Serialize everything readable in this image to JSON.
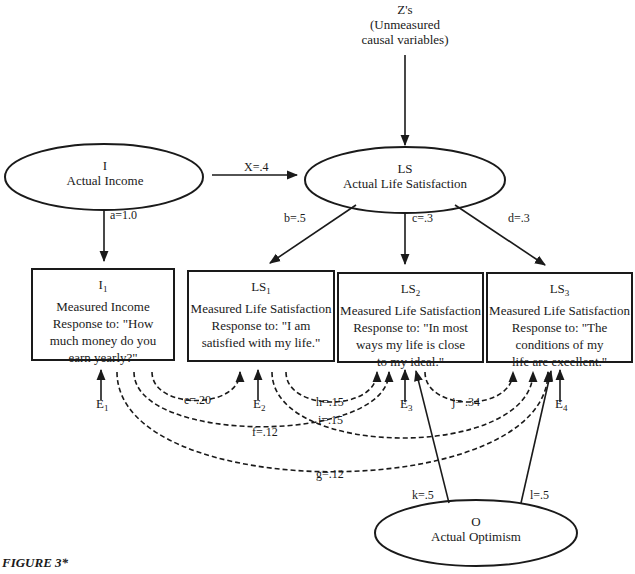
{
  "figure": {
    "caption": "FIGURE 3*"
  },
  "latent_nodes": {
    "z": {
      "line1": "Z's",
      "line2": "(Unmeasured",
      "line3": "causal variables)"
    },
    "income": {
      "symbol": "I",
      "label": "Actual Income"
    },
    "life_satisfaction": {
      "symbol": "LS",
      "label": "Actual Life Satisfaction"
    },
    "optimism": {
      "symbol": "O",
      "label": "Actual Optimism"
    }
  },
  "measured_nodes": [
    {
      "symbol": "I",
      "subscript": "1",
      "title": "Measured Income",
      "line1": "Response to: \"How",
      "line2": "much money do you",
      "line3": "earn yearly?\""
    },
    {
      "symbol": "LS",
      "subscript": "1",
      "title": "Measured Life Satisfaction",
      "line1": "Response to: \"I am",
      "line2": "satisfied with my life.\"",
      "line3": ""
    },
    {
      "symbol": "LS",
      "subscript": "2",
      "title": "Measured Life Satisfaction",
      "line1": "Response to: \"In most",
      "line2": "ways my life is close",
      "line3": "to my ideal.\""
    },
    {
      "symbol": "LS",
      "subscript": "3",
      "title": "Measured Life Satisfaction",
      "line1": "Response to: \"The",
      "line2": "conditions of my",
      "line3": "life are excellent.\""
    }
  ],
  "errors": [
    {
      "symbol": "E",
      "subscript": "1"
    },
    {
      "symbol": "E",
      "subscript": "2"
    },
    {
      "symbol": "E",
      "subscript": "3"
    },
    {
      "symbol": "E",
      "subscript": "4"
    }
  ],
  "paths": {
    "x": "X=.4",
    "a": "a=1.0",
    "b": "b=.5",
    "c": "c=.3",
    "d": "d=.3",
    "k": "k=.5",
    "l": "l=.5"
  },
  "correlations": {
    "e": "e=.20",
    "f": "f=.12",
    "g": "g=.12",
    "h": "h=.15",
    "i": "i=.15",
    "j": "j= .34"
  },
  "colors": {
    "ink": "#1a1a1a",
    "background": "#ffffff"
  }
}
